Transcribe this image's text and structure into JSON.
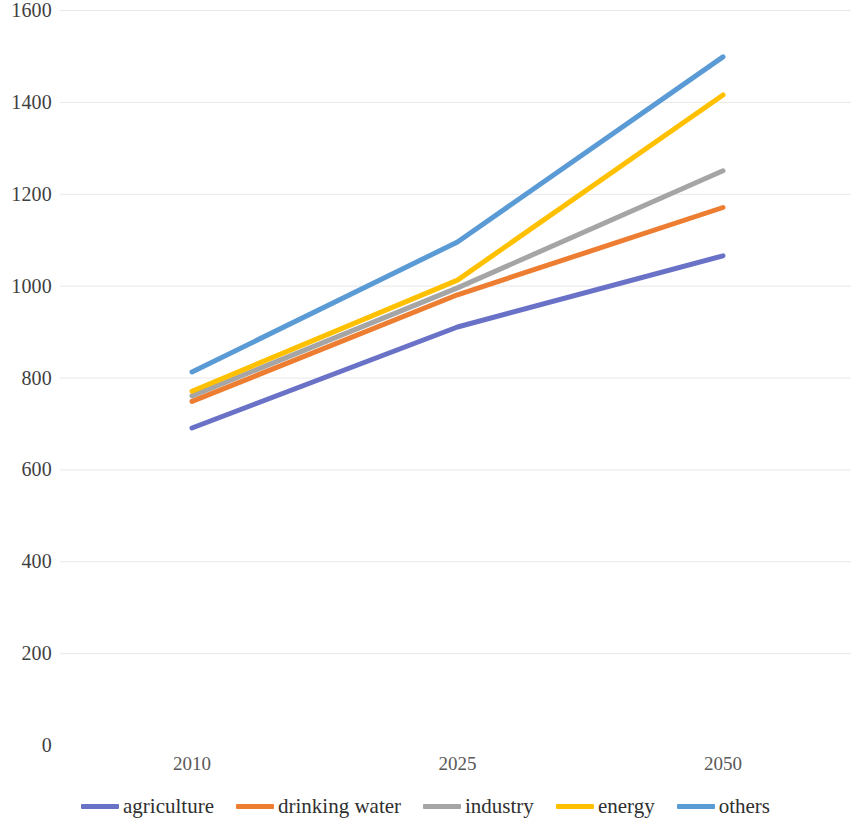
{
  "chart_data": {
    "type": "line",
    "title": "",
    "subtitle": "",
    "xlabel": "",
    "ylabel": "",
    "x": [
      "2010",
      "2025",
      "2050"
    ],
    "categories": [
      "2010",
      "2025",
      "2050"
    ],
    "xtick_labels": [
      "2010",
      "2025",
      "2050"
    ],
    "ytick_labels": [
      "0",
      "200",
      "400",
      "600",
      "800",
      "1000",
      "1200",
      "1400",
      "1600"
    ],
    "ytick_values": [
      0,
      200,
      400,
      600,
      800,
      1000,
      1200,
      1400,
      1600
    ],
    "ylim": [
      0,
      1600
    ],
    "grid": "horizontal",
    "legend_position": "bottom",
    "series": [
      {
        "name": "agriculture",
        "color": "#6A72C8",
        "values": [
          690,
          910,
          1065
        ]
      },
      {
        "name": "drinking water",
        "color": "#ED7D31",
        "values": [
          748,
          980,
          1170
        ]
      },
      {
        "name": "industry",
        "color": "#A5A5A5",
        "values": [
          760,
          995,
          1250
        ]
      },
      {
        "name": "energy",
        "color": "#FFC000",
        "values": [
          770,
          1012,
          1415
        ]
      },
      {
        "name": "others",
        "color": "#5B9BD5",
        "values": [
          812,
          1095,
          1498
        ]
      }
    ]
  },
  "legend": {
    "items": [
      {
        "label": "agriculture",
        "color": "#6A72C8"
      },
      {
        "label": "drinking water",
        "color": "#ED7D31"
      },
      {
        "label": "industry",
        "color": "#A5A5A5"
      },
      {
        "label": "energy",
        "color": "#FFC000"
      },
      {
        "label": "others",
        "color": "#5B9BD5"
      }
    ]
  },
  "style": {
    "gridline_color": "#e8e8e8",
    "axis_text_color": "#404040",
    "background": "#ffffff",
    "line_width": 5
  }
}
